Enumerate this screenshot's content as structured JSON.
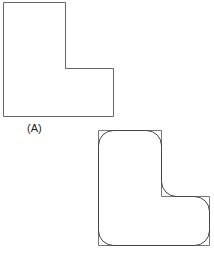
{
  "figure": {
    "panel_a": {
      "label": "(A)",
      "shape": "L-shaped outline with sharp corners"
    },
    "panel_b": {
      "label": "",
      "shape": "L-shaped outline with rounded (filleted) corners overlaid on sharp-corner outline"
    },
    "colors": {
      "stroke": "#555555",
      "background": "#ffffff"
    }
  }
}
